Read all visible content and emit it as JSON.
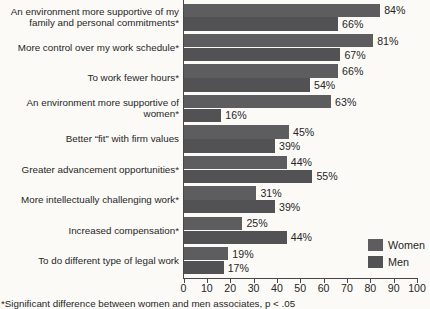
{
  "chart_data": {
    "type": "bar",
    "orientation": "horizontal",
    "title": "",
    "categories": [
      "An environment more supportive of my family and personal commitments*",
      "More control over my work schedule*",
      "To work fewer hours*",
      "An environment more supportive of women*",
      "Better “fit” with firm values",
      "Greater advancement opportunities*",
      "More intellectually challenging work*",
      "Increased compensation*",
      "To do different type of legal work"
    ],
    "category_line_breaks": [
      [
        "An environment more supportive of my",
        "family and personal commitments*"
      ],
      [
        "More control over my work schedule*"
      ],
      [
        "To work fewer hours*"
      ],
      [
        "An environment more supportive of",
        "women*"
      ],
      [
        "Better “fit” with firm values"
      ],
      [
        "Greater advancement opportunities*"
      ],
      [
        "More intellectually challenging work*"
      ],
      [
        "Increased compensation*"
      ],
      [
        "To do different type of legal work"
      ]
    ],
    "series": [
      {
        "name": "Women",
        "color": "#5d5d5f",
        "values": [
          84,
          81,
          66,
          63,
          45,
          44,
          31,
          25,
          19
        ]
      },
      {
        "name": "Men",
        "color": "#525254",
        "values": [
          66,
          67,
          54,
          16,
          39,
          55,
          39,
          44,
          17
        ]
      }
    ],
    "value_suffix": "%",
    "x_axis": {
      "min": 0,
      "max": 100,
      "tick_step": 10,
      "tick_labels": [
        "0",
        "10",
        "20",
        "30",
        "40",
        "50",
        "60",
        "70",
        "80",
        "90",
        "100"
      ]
    },
    "legend": {
      "position": "bottom-right",
      "entries": [
        "Women",
        "Men"
      ]
    },
    "footnote": "*Significant difference between women and men associates, p < .05"
  },
  "colors": {
    "background": "#fbfaf7",
    "axis": "#474747",
    "text": "#262626"
  }
}
